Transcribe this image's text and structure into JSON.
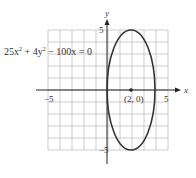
{
  "chart_data": {
    "type": "line",
    "title": "",
    "equation": {
      "text_parts": [
        "25x",
        "2",
        " + 4y",
        "2",
        " − 100x = 0"
      ]
    },
    "xlabel": "x",
    "ylabel": "y",
    "xlim": [
      -5,
      5
    ],
    "ylim": [
      -5,
      5
    ],
    "grid": true,
    "x_ticks": [
      {
        "value": -5,
        "label": "−5"
      },
      {
        "value": 5,
        "label": "5"
      }
    ],
    "y_ticks": [
      {
        "value": 5,
        "label": "5"
      },
      {
        "value": -5,
        "label": "−5"
      }
    ],
    "series": [
      {
        "name": "ellipse",
        "kind": "ellipse",
        "center": [
          2,
          0
        ],
        "semi_x": 2,
        "semi_y": 5,
        "color": "#333333"
      }
    ],
    "points": [
      {
        "x": 2,
        "y": 0,
        "label": "(2, 0)"
      }
    ]
  }
}
